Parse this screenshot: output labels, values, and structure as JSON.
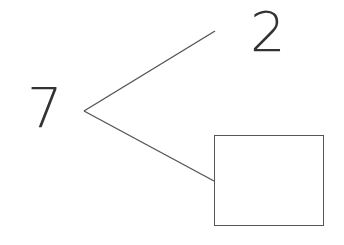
{
  "number_bond": {
    "whole": "7",
    "parts": [
      "2",
      ""
    ],
    "missing_part_placeholder": "empty-box"
  },
  "colors": {
    "stroke": "#555555",
    "text": "#333333",
    "background": "#ffffff"
  }
}
